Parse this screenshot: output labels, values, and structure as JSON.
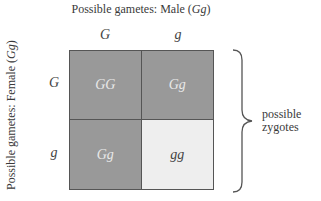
{
  "diagram": {
    "type": "punnett-square",
    "top_axis": {
      "label_prefix": "Possible gametes: Male (",
      "label_genotype": "Gg",
      "label_suffix": ")",
      "columns": [
        "G",
        "g"
      ]
    },
    "side_axis": {
      "label_prefix": "Possible gametes: Female (",
      "label_genotype": "Gg",
      "label_suffix": ")",
      "rows": [
        "G",
        "g"
      ]
    },
    "cells": [
      {
        "text": "GG",
        "fill": "#999999",
        "text_color": "#e8e8e8"
      },
      {
        "text": "Gg",
        "fill": "#999999",
        "text_color": "#e8e8e8"
      },
      {
        "text": "Gg",
        "fill": "#999999",
        "text_color": "#e8e8e8"
      },
      {
        "text": "gg",
        "fill": "#eeeeee",
        "text_color": "#444444"
      }
    ],
    "brace_label": {
      "line1": "possible",
      "line2": "zygotes"
    },
    "colors": {
      "border": "#555555",
      "dominant_fill": "#999999",
      "recessive_fill": "#eeeeee"
    }
  }
}
